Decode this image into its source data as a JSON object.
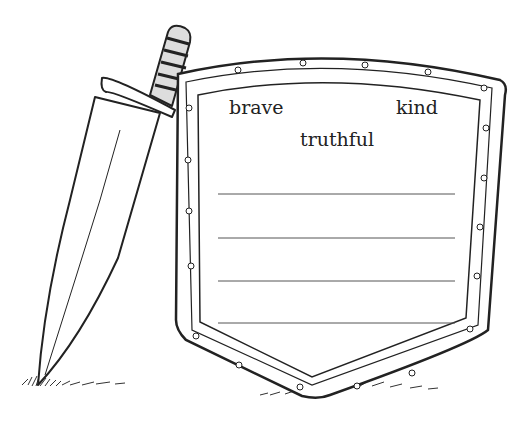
{
  "illustration": {
    "subject": "shield and sword worksheet",
    "words": [
      "brave",
      "kind",
      "truthful"
    ],
    "writing_lines": 4,
    "icons": [
      "sword-icon",
      "shield-icon",
      "grass-icon"
    ]
  }
}
